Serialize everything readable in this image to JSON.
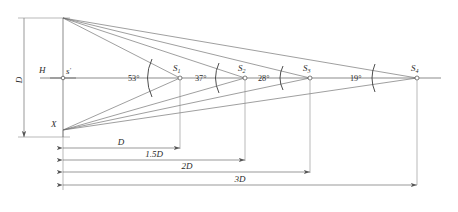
{
  "figure": {
    "type": "geometry-ray-diagram",
    "background_color": "#ffffff",
    "line_color": "#5a5a5a",
    "text_color": "#2b2b2b"
  },
  "labels": {
    "height_marker": "H",
    "source_point": "s",
    "source_prime": "′",
    "origin_point": "X",
    "vertical_dimension": "D"
  },
  "image_points": [
    {
      "name": "S",
      "subscript": "1"
    },
    {
      "name": "S",
      "subscript": "2"
    },
    {
      "name": "S",
      "subscript": "3"
    },
    {
      "name": "S",
      "subscript": "4"
    }
  ],
  "angles": [
    {
      "value": "53°",
      "at": "S1"
    },
    {
      "value": "37°",
      "at": "S2-left"
    },
    {
      "value": "28°",
      "at": "S2-right"
    },
    {
      "value": "19°",
      "at": "S4"
    }
  ],
  "dimensions": [
    {
      "label": "D"
    },
    {
      "label": "1.5D"
    },
    {
      "label": "2D"
    },
    {
      "label": "3D"
    }
  ]
}
